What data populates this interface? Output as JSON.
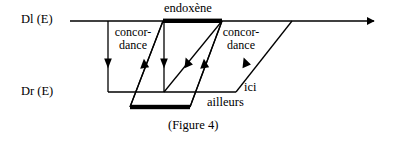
{
  "figure": {
    "caption": "(Figure 4)",
    "axes": {
      "upper_label": "Dl (E)",
      "lower_label": "Dr (E)"
    },
    "labels": {
      "endoxene": "endoxène",
      "concordance_left_line1": "concor-",
      "concordance_left_line2": "dance",
      "concordance_right_line1": "concor-",
      "concordance_right_line2": "dance",
      "ici": "ici",
      "ailleurs": "ailleurs"
    },
    "colors": {
      "ink": "#000000",
      "background": "#ffffff"
    },
    "geometry": {
      "upper_axis": {
        "x1": 70,
        "y": 21,
        "x2": 378,
        "arrow": "right"
      },
      "lower_axis": {
        "x1": 108,
        "y": 92,
        "x2": 236,
        "arrow": "none"
      },
      "endoxene_bar": {
        "x1": 163,
        "x2": 222,
        "y": 21,
        "thickness": 4
      },
      "ailleurs_bar": {
        "x1": 130,
        "x2": 190,
        "y": 107,
        "thickness": 4
      },
      "vertical_connectors": [
        {
          "x": 108,
          "y1": 21,
          "y2": 92,
          "arrow_y": 64
        },
        {
          "x": 164,
          "y1": 21,
          "y2": 92,
          "arrow_y": 64
        }
      ],
      "slant_connectors": [
        {
          "x1": 163,
          "y1": 21,
          "x2": 130,
          "y2": 107
        },
        {
          "x1": 222,
          "y1": 21,
          "x2": 190,
          "y2": 107
        }
      ],
      "rising_connectors": [
        {
          "x1": 130,
          "y1": 107,
          "x2": 163,
          "y2": 21,
          "arrow_at": 0.5
        },
        {
          "x1": 164,
          "y1": 92,
          "x2": 222,
          "y2": 21,
          "arrow_at": 0.52
        },
        {
          "x1": 190,
          "y1": 107,
          "x2": 222,
          "y2": 21,
          "arrow_at": 0.5
        },
        {
          "x1": 236,
          "y1": 92,
          "x2": 292,
          "y2": 21,
          "arrow_at": 0.52
        }
      ]
    }
  }
}
